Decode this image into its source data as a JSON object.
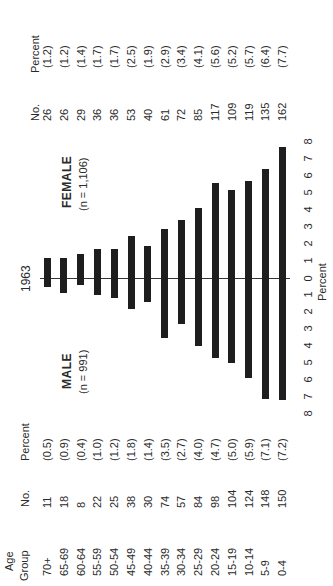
{
  "chart_data": {
    "type": "bar",
    "orientation": "population-pyramid (rotated 90° counter-clockwise)",
    "title": "1963",
    "xlabel": "Percent",
    "ylabel": "Age Group",
    "categories": [
      "70+",
      "65-69",
      "60-64",
      "55-59",
      "50-54",
      "45-49",
      "40-44",
      "35-39",
      "30-34",
      "25-29",
      "20-24",
      "15-19",
      "10-14",
      "5-9",
      "0-4"
    ],
    "series": [
      {
        "name": "MALE",
        "n_label": "(n = 991)",
        "counts": [
          11,
          18,
          8,
          22,
          25,
          38,
          30,
          74,
          57,
          84,
          98,
          104,
          124,
          148,
          150
        ],
        "values": [
          0.5,
          0.9,
          0.4,
          1.0,
          1.2,
          1.8,
          1.4,
          3.5,
          2.7,
          4.0,
          4.7,
          5.0,
          5.9,
          7.1,
          7.2
        ],
        "percent_labels": [
          "(0.5)",
          "(0.9)",
          "(0.4)",
          "(1.0)",
          "(1.2)",
          "(1.8)",
          "(1.4)",
          "(3.5)",
          "(2.7)",
          "(4.0)",
          "(4.7)",
          "(5.0)",
          "(5.9)",
          "(7.1)",
          "(7.2)"
        ]
      },
      {
        "name": "FEMALE",
        "n_label": "(n = 1,106)",
        "counts": [
          26,
          26,
          29,
          36,
          36,
          53,
          40,
          61,
          72,
          85,
          117,
          109,
          119,
          135,
          162
        ],
        "values": [
          1.2,
          1.2,
          1.4,
          1.7,
          1.7,
          2.5,
          1.9,
          2.9,
          3.4,
          4.1,
          5.6,
          5.2,
          5.7,
          6.4,
          7.7
        ],
        "percent_labels": [
          "(1.2)",
          "(1.2)",
          "(1.4)",
          "(1.7)",
          "(1.7)",
          "(2.5)",
          "(1.9)",
          "(2.9)",
          "(3.4)",
          "(4.1)",
          "(5.6)",
          "(5.2)",
          "(5.7)",
          "(6.4)",
          "(7.7)"
        ]
      }
    ],
    "axis_ticks_male": [
      "8",
      "7",
      "6",
      "5",
      "4",
      "3",
      "2",
      "1",
      "0"
    ],
    "axis_ticks_female": [
      "1",
      "2",
      "3",
      "4",
      "5",
      "6",
      "7",
      "8"
    ],
    "xlim": [
      0,
      8
    ],
    "grid": false,
    "legend": "none (side labels MALE / FEMALE)"
  },
  "labels": {
    "year": "1963",
    "male": "MALE",
    "male_n": "(n = 991)",
    "female": "FEMALE",
    "female_n": "(n = 1,106)",
    "axis_label": "Percent"
  },
  "table_headers": {
    "age_line1": "Age",
    "age_line2": "Group",
    "no": "No.",
    "percent": "Percent"
  },
  "style": {
    "bar_color": "#1e1e1e",
    "axis_color": "#333333",
    "text_color": "#2a2a2a"
  }
}
